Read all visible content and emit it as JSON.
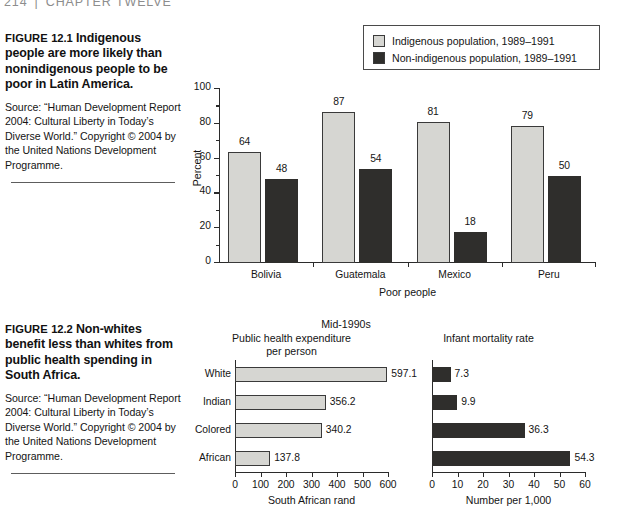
{
  "running_head": {
    "page_number": "214",
    "separator": "|",
    "chapter": "CHAPTER TWELVE"
  },
  "figure_12_1": {
    "caption": {
      "figure_word": "FIGURE",
      "figure_number": "12.1",
      "title": "Indigenous people are more likely than nonindigenous people to be poor in Latin America.",
      "source": "Source: “Human Development Report 2004: Cultural Liberty in Today’s Diverse World.” Copyright © 2004 by the United Nations Development Programme."
    },
    "legend": {
      "items": [
        {
          "label": "Indigenous population, 1989–1991",
          "color": "#d6d6d2",
          "swatch": "light"
        },
        {
          "label": "Non-indigenous population, 1989–1991",
          "color": "#2f2e2c",
          "swatch": "dark"
        }
      ]
    },
    "chart_data": {
      "type": "bar",
      "title": "",
      "categories": [
        "Bolivia",
        "Guatemala",
        "Mexico",
        "Peru"
      ],
      "series": [
        {
          "name": "Indigenous population, 1989–1991",
          "color": "#d6d6d2",
          "values": [
            64,
            87,
            81,
            79
          ]
        },
        {
          "name": "Non-indigenous population, 1989–1991",
          "color": "#2f2e2c",
          "values": [
            48,
            54,
            18,
            50
          ]
        }
      ],
      "xlabel": "Poor people",
      "ylabel": "Percent",
      "ylim": [
        0,
        100
      ],
      "yticks": [
        0,
        20,
        40,
        60,
        80,
        100
      ],
      "yticks_minor": [
        10,
        30,
        50,
        70,
        90
      ],
      "ytick_labels": [
        "0",
        "20",
        "40",
        "60",
        "80",
        "100"
      ],
      "grid": false,
      "legend_position": "top-right",
      "data_labels": true
    }
  },
  "figure_12_2": {
    "caption": {
      "figure_word": "FIGURE",
      "figure_number": "12.2",
      "title": "Non-whites benefit less than whites from public health spending in South Africa.",
      "source": "Source: “Human Development Report 2004: Cultural Liberty in Today’s Diverse World.” Copyright © 2004 by the United Nations Development Programme."
    },
    "overall_title": "Mid-1990s",
    "chart_data": [
      {
        "type": "bar",
        "orientation": "horizontal",
        "title": "Public health expenditure per person",
        "title_line1": "Public health expenditure",
        "title_line2": "per person",
        "categories": [
          "White",
          "Indian",
          "Colored",
          "African"
        ],
        "values": [
          597.1,
          356.2,
          340.2,
          137.8
        ],
        "value_labels": [
          "597.1",
          "356.2",
          "340.2",
          "137.8"
        ],
        "bar_color": "#d6d6d2",
        "xlabel": "South African rand",
        "ylabel": "",
        "xlim": [
          0,
          600
        ],
        "xticks": [
          0,
          100,
          200,
          300,
          400,
          500,
          600
        ],
        "xtick_labels": [
          "0",
          "100",
          "200",
          "300",
          "400",
          "500",
          "600"
        ],
        "grid": false,
        "data_labels": true
      },
      {
        "type": "bar",
        "orientation": "horizontal",
        "title": "Infant mortality rate",
        "title_line1": "Infant mortality rate",
        "title_line2": "",
        "categories": [
          "White",
          "Indian",
          "Colored",
          "African"
        ],
        "values": [
          7.3,
          9.9,
          36.3,
          54.3
        ],
        "value_labels": [
          "7.3",
          "9.9",
          "36.3",
          "54.3"
        ],
        "bar_color": "#2f2e2c",
        "xlabel": "Number per 1,000",
        "ylabel": "",
        "xlim": [
          0,
          60
        ],
        "xticks": [
          0,
          10,
          20,
          30,
          40,
          50,
          60
        ],
        "xtick_labels": [
          "0",
          "10",
          "20",
          "30",
          "40",
          "50",
          "60"
        ],
        "grid": false,
        "data_labels": true
      }
    ]
  }
}
